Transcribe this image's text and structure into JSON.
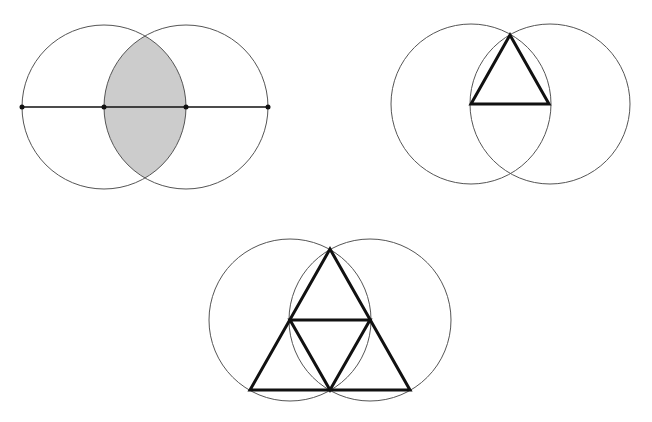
{
  "colors": {
    "background": "#ffffff",
    "circle_stroke": "#555555",
    "line_stroke": "#111111",
    "lens_fill": "#cccccc"
  },
  "figures": [
    {
      "name": "vesica-piscis-with-diameter",
      "circles": [
        {
          "cx": 104,
          "cy": 107,
          "r": 82
        },
        {
          "cx": 186,
          "cy": 107,
          "r": 82
        }
      ],
      "lens": {
        "top": [
          145,
          36
        ],
        "bottom": [
          145,
          178
        ],
        "r": 82
      },
      "line": {
        "x1": 22,
        "y1": 107,
        "x2": 268,
        "y2": 107
      },
      "points": [
        [
          22,
          107
        ],
        [
          104,
          107
        ],
        [
          186,
          107
        ],
        [
          268,
          107
        ]
      ]
    },
    {
      "name": "vesica-piscis-with-triangle",
      "circles": [
        {
          "cx": 471,
          "cy": 104,
          "r": 80
        },
        {
          "cx": 550,
          "cy": 104,
          "r": 80
        }
      ],
      "triangle": [
        [
          510,
          35
        ],
        [
          471,
          104
        ],
        [
          549,
          104
        ]
      ]
    },
    {
      "name": "vesica-piscis-with-subdivided-triangle",
      "circles": [
        {
          "cx": 290,
          "cy": 320,
          "r": 81
        },
        {
          "cx": 370,
          "cy": 320,
          "r": 81
        }
      ],
      "outer_triangle": [
        [
          330,
          249
        ],
        [
          250,
          390
        ],
        [
          410,
          390
        ]
      ],
      "inner_triangle": [
        [
          290,
          320
        ],
        [
          370,
          320
        ],
        [
          330,
          390
        ]
      ]
    }
  ]
}
